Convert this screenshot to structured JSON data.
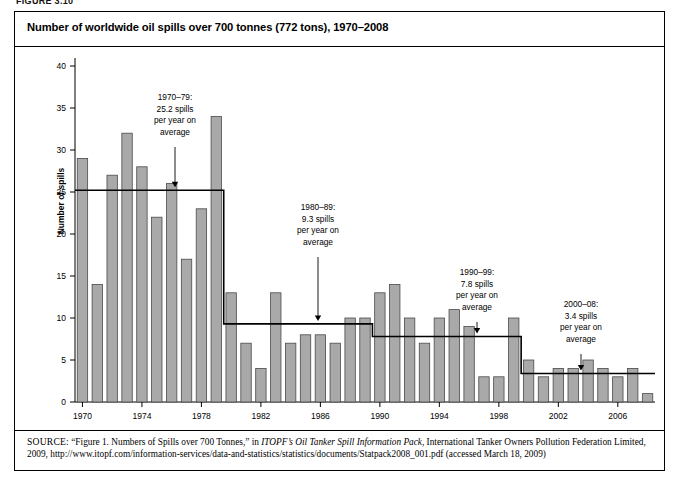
{
  "figure_label": "FIGURE 3.10",
  "title": "Number of worldwide oil spills over 700 tonnes (772 tons), 1970–2008",
  "axes": {
    "ylabel": "Number of spills",
    "yticks": [
      0,
      5,
      10,
      15,
      20,
      25,
      30,
      35,
      40
    ],
    "xticks": [
      1970,
      1974,
      1978,
      1982,
      1986,
      1990,
      1994,
      1998,
      2002,
      2006
    ]
  },
  "annotations": [
    {
      "id": "anno-1970s",
      "lines": [
        "1970–79:",
        "25.2 spills",
        "per year on",
        "average"
      ],
      "period": "1970–79",
      "average": 25.2
    },
    {
      "id": "anno-1980s",
      "lines": [
        "1980–89:",
        "9.3 spills",
        "per year on",
        "average"
      ],
      "period": "1980–89",
      "average": 9.3
    },
    {
      "id": "anno-1990s",
      "lines": [
        "1990–99:",
        "7.8 spills",
        "per year on",
        "average"
      ],
      "period": "1990–99",
      "average": 7.8
    },
    {
      "id": "anno-2000s",
      "lines": [
        "2000–08:",
        "3.4 spills",
        "per year on",
        "average"
      ],
      "period": "2000–08",
      "average": 3.4
    }
  ],
  "source": {
    "prefix": "SOURCE:",
    "text_1": " “Figure 1. Numbers of Spills over 700 Tonnes,” in ",
    "italic_1": "ITOPF’s Oil Tanker Spill Information Pack",
    "text_2": ", International Tanker Owners Pollution Federation Limited, 2009, http://www.itopf.com/information-services/data-and-statistics/statistics/documents/Statpack2008_001.pdf (accessed March 18, 2009)"
  },
  "colors": {
    "bar_fill": "#a9a9a9",
    "bar_stroke": "#4a4a4a",
    "axis": "#000000",
    "average_line": "#000000",
    "background": "#ffffff"
  },
  "chart_data": {
    "type": "bar",
    "title": "Number of worldwide oil spills over 700 tonnes (772 tons), 1970–2008",
    "xlabel": "",
    "ylabel": "Number of spills",
    "ylim": [
      0,
      40
    ],
    "grid": false,
    "legend": "none",
    "categories": [
      1970,
      1971,
      1972,
      1973,
      1974,
      1975,
      1976,
      1977,
      1978,
      1979,
      1980,
      1981,
      1982,
      1983,
      1984,
      1985,
      1986,
      1987,
      1988,
      1989,
      1990,
      1991,
      1992,
      1993,
      1994,
      1995,
      1996,
      1997,
      1998,
      1999,
      2000,
      2001,
      2002,
      2003,
      2004,
      2005,
      2006,
      2007,
      2008
    ],
    "values": [
      29,
      14,
      27,
      32,
      28,
      22,
      26,
      17,
      23,
      34,
      13,
      7,
      4,
      13,
      7,
      8,
      8,
      7,
      10,
      10,
      13,
      14,
      10,
      7,
      10,
      11,
      9,
      3,
      3,
      10,
      5,
      3,
      4,
      4,
      5,
      4,
      3,
      4,
      1
    ],
    "series": [
      {
        "name": "Number of spills over 700 tonnes",
        "values": [
          29,
          14,
          27,
          32,
          28,
          22,
          26,
          17,
          23,
          34,
          13,
          7,
          4,
          13,
          7,
          8,
          8,
          7,
          10,
          10,
          13,
          14,
          10,
          7,
          10,
          11,
          9,
          3,
          3,
          10,
          5,
          3,
          4,
          4,
          5,
          4,
          3,
          4,
          1
        ]
      }
    ],
    "overlay_line": {
      "name": "Decadal average spills per year",
      "type": "step",
      "segments": [
        {
          "period": "1970–1979",
          "value": 25.2,
          "x_start": 1970,
          "x_end": 1979
        },
        {
          "period": "1980–1989",
          "value": 9.3,
          "x_start": 1980,
          "x_end": 1989
        },
        {
          "period": "1990–1999",
          "value": 7.8,
          "x_start": 1990,
          "x_end": 1999
        },
        {
          "period": "2000–2008",
          "value": 3.4,
          "x_start": 2000,
          "x_end": 2008
        }
      ]
    }
  }
}
